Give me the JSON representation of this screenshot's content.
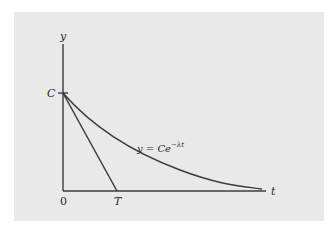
{
  "diagram": {
    "type": "exponential-decay-graph",
    "axes": {
      "x_label": "t",
      "y_label": "y",
      "origin_label": "0"
    },
    "labels": {
      "intercept": "C",
      "tangent_intercept": "T",
      "curve_equation_prefix": "y = Ce",
      "curve_equation_exponent": "−λt"
    },
    "elements": [
      {
        "name": "exponential-curve",
        "equation": "y = Ce^(−λt)"
      },
      {
        "name": "tangent-line",
        "from": "C",
        "to": "T"
      }
    ],
    "colors": {
      "background": "#ffffff",
      "panel": "#e9e9e9",
      "stroke": "#3c3c3c",
      "text": "#2a2a2a"
    }
  }
}
